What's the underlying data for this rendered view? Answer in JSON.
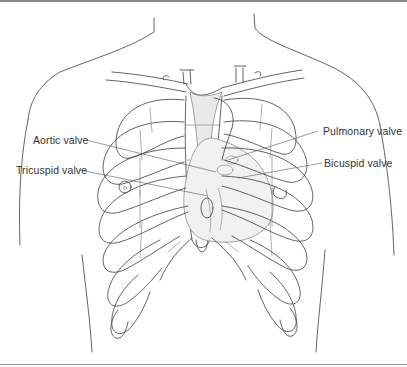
{
  "diagram": {
    "labels": [
      {
        "id": "aortic",
        "text": "Aortic valve",
        "side": "left"
      },
      {
        "id": "tricuspid",
        "text": "Tricuspid valve",
        "side": "left"
      },
      {
        "id": "pulmonary",
        "text": "Pulmonary valve",
        "side": "right"
      },
      {
        "id": "bicuspid",
        "text": "Bicuspid valve",
        "side": "right"
      }
    ],
    "colors": {
      "line": "#3c3c3c",
      "label_text": "#333333",
      "frame": "#8a8a8a",
      "background": "#ffffff"
    }
  }
}
